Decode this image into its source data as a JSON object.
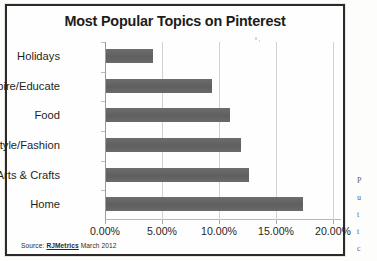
{
  "chart_data": {
    "type": "bar",
    "orientation": "horizontal",
    "title": "Most Popular Topics on Pinterest",
    "xlabel": "",
    "ylabel": "",
    "categories": [
      "Home",
      "Arts & Crafts",
      "Style/Fashion",
      "Food",
      "Inspire/Educate",
      "Holidays"
    ],
    "values": [
      17.3,
      12.5,
      11.8,
      10.9,
      9.3,
      4.1
    ],
    "value_unit": "%",
    "xlim": [
      0,
      20
    ],
    "xticks": [
      0,
      5,
      10,
      15,
      20
    ],
    "xtick_labels": [
      "0.00%",
      "5.00%",
      "10.00%",
      "15.00%",
      "20.00%"
    ],
    "grid": "vertical",
    "legend": "none",
    "series": [
      {
        "name": "Share of pins",
        "values": [
          17.3,
          12.5,
          11.8,
          10.9,
          9.3,
          4.1
        ]
      }
    ],
    "bar_color": "#656565",
    "gridline_color": "#d2d2d2"
  },
  "chart": {
    "title": "Most Popular Topics on Pinterest",
    "source_label": "Source:",
    "source_name": "RJMetrics",
    "source_date": "March 2012"
  },
  "side_text_fragment": [
    "P",
    "u",
    "t",
    "t",
    "c"
  ]
}
